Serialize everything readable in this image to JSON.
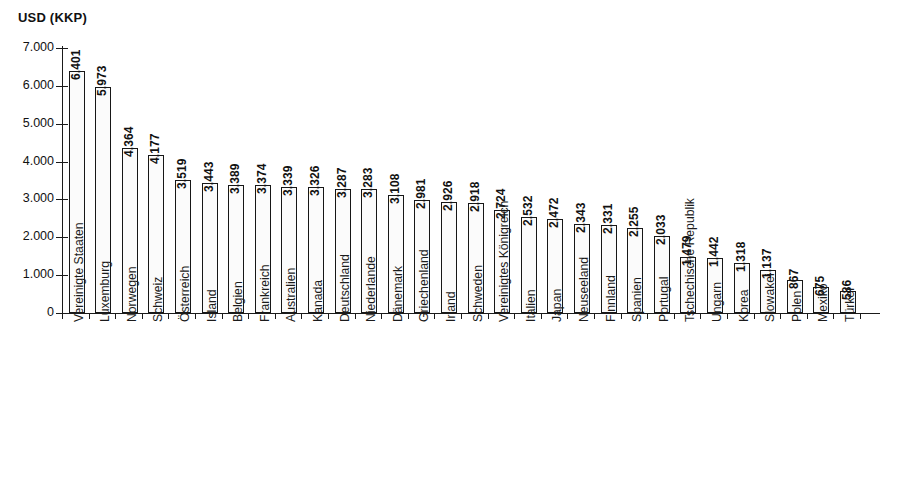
{
  "chart_data": {
    "type": "bar",
    "title": "",
    "ylabel": "USD (KKP)",
    "xlabel": "",
    "ylim": [
      0,
      7000
    ],
    "ytick_labels": [
      "7.000",
      "6.000",
      "5.000",
      "4.000",
      "3.000",
      "2.000",
      "1.000",
      "0"
    ],
    "ytick_values": [
      7000,
      6000,
      5000,
      4000,
      3000,
      2000,
      1000,
      0
    ],
    "grid": false,
    "legend": null,
    "value_label_format": "european-thousands-dot",
    "categories": [
      "Vereinigte Staaten",
      "Luxemburg",
      "Norwegen",
      "Schweiz",
      "Österreich",
      "Island",
      "Belgien",
      "Frankreich",
      "Australien",
      "Kanada",
      "Deutschland",
      "Niederlande",
      "Dänemark",
      "Griechenland",
      "Irland",
      "Schweden",
      "Vereinigtes Königreich",
      "Italien",
      "Japan",
      "Neuseeland",
      "Finnland",
      "Spanien",
      "Portugal",
      "Tschechische Republik",
      "Ungarn",
      "Korea",
      "Slowakei",
      "Polen",
      "Mexiko",
      "Türkei"
    ],
    "values": [
      6401,
      5973,
      4364,
      4177,
      3519,
      3443,
      3389,
      3374,
      3339,
      3326,
      3287,
      3283,
      3108,
      2981,
      2926,
      2918,
      2724,
      2532,
      2472,
      2343,
      2331,
      2255,
      2033,
      1479,
      1442,
      1318,
      1137,
      867,
      675,
      586
    ],
    "value_labels": [
      "6.401",
      "5.973",
      "4.364",
      "4.177",
      "3.519",
      "3.443",
      "3.389",
      "3.374",
      "3.339",
      "3.326",
      "3.287",
      "3.283",
      "3.108",
      "2.981",
      "2.926",
      "2.918",
      "2.724",
      "2.532",
      "2.472",
      "2.343",
      "2.331",
      "2.255",
      "2.033",
      "1.479",
      "1.442",
      "1.318",
      "1.137",
      "867",
      "675",
      "586"
    ],
    "colors": {
      "bar_fill": "#fbfbfb",
      "bar_stroke": "#171717",
      "axis": "#1a1a1a",
      "text": "#111111",
      "background": "#ffffff"
    }
  }
}
